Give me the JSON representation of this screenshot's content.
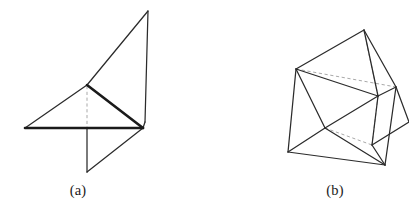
{
  "page": {
    "background_color": "#ffffff",
    "width": 409,
    "height": 212
  },
  "style": {
    "solid_edge_color": "#2b2b2b",
    "bold_edge_color": "#1a1a1a",
    "hidden_edge_color": "#a9a9a9",
    "caption_color": "#1a1a1a"
  },
  "figures": [
    {
      "id": "figure-a",
      "caption": "(a)",
      "description": "folded polyhedral flat-foldable surface, view a",
      "vertices": {
        "apex_top": [
          148,
          11
        ],
        "upper_mid": [
          87,
          85
        ],
        "base_left": [
          25,
          128
        ],
        "base_right": [
          143,
          128
        ],
        "right_upper": [
          145,
          120
        ],
        "bottom_spike": [
          87,
          172
        ]
      },
      "solid_edges": [
        [
          [
            148,
            11
          ],
          [
            87,
            85
          ]
        ],
        [
          [
            148,
            11
          ],
          [
            145,
            122
          ]
        ],
        [
          [
            87,
            85
          ],
          [
            25,
            128
          ]
        ],
        [
          [
            25,
            128
          ],
          [
            143,
            128
          ]
        ],
        [
          [
            143,
            128
          ],
          [
            87,
            172
          ]
        ],
        [
          [
            87,
            172
          ],
          [
            87,
            128
          ]
        ]
      ],
      "bold_edges": [
        [
          [
            87,
            85
          ],
          [
            143,
            128
          ]
        ],
        [
          [
            25,
            128
          ],
          [
            143,
            128
          ]
        ]
      ],
      "hidden_edges": [
        [
          [
            87,
            85
          ],
          [
            87,
            128
          ]
        ]
      ]
    },
    {
      "id": "figure-b",
      "caption": "(b)",
      "description": "folded polyhedral flat-foldable surface, view b",
      "vertices": {
        "top": [
          364,
          30
        ],
        "left": [
          296,
          69
        ],
        "right": [
          396,
          87
        ],
        "center": [
          325,
          128
        ],
        "bottom_left": [
          288,
          152
        ],
        "bottom_right": [
          385,
          165
        ],
        "right_mid": [
          378,
          96
        ],
        "right_tip": [
          409,
          122
        ],
        "lower_sliver": [
          372,
          145
        ]
      },
      "solid_edges": [
        [
          [
            364,
            30
          ],
          [
            296,
            69
          ]
        ],
        [
          [
            364,
            30
          ],
          [
            396,
            87
          ]
        ],
        [
          [
            296,
            69
          ],
          [
            288,
            152
          ]
        ],
        [
          [
            296,
            69
          ],
          [
            325,
            128
          ]
        ],
        [
          [
            296,
            69
          ],
          [
            378,
            96
          ]
        ],
        [
          [
            288,
            152
          ],
          [
            325,
            128
          ]
        ],
        [
          [
            288,
            152
          ],
          [
            385,
            165
          ]
        ],
        [
          [
            325,
            128
          ],
          [
            385,
            165
          ]
        ],
        [
          [
            325,
            128
          ],
          [
            378,
            96
          ]
        ],
        [
          [
            378,
            96
          ],
          [
            396,
            87
          ]
        ],
        [
          [
            396,
            87
          ],
          [
            385,
            165
          ]
        ],
        [
          [
            378,
            96
          ],
          [
            372,
            145
          ]
        ],
        [
          [
            372,
            145
          ],
          [
            385,
            165
          ]
        ],
        [
          [
            396,
            87
          ],
          [
            409,
            122
          ]
        ],
        [
          [
            409,
            122
          ],
          [
            372,
            145
          ]
        ]
      ],
      "bold_edges": [],
      "hidden_edges": [
        [
          [
            364,
            30
          ],
          [
            378,
            96
          ]
        ],
        [
          [
            296,
            69
          ],
          [
            396,
            87
          ]
        ],
        [
          [
            378,
            96
          ],
          [
            372,
            145
          ]
        ],
        [
          [
            325,
            128
          ],
          [
            372,
            145
          ]
        ]
      ]
    }
  ]
}
